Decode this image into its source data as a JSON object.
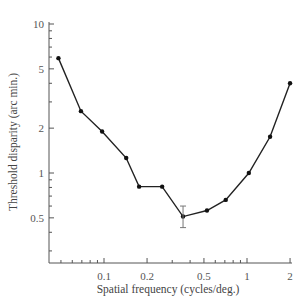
{
  "chart_data": {
    "type": "line",
    "title": "",
    "xlabel": "Spatial frequency (cycles/deg.)",
    "ylabel": "Threshold disparity (arc min.)",
    "xscale": "log",
    "yscale": "log",
    "xlim": [
      0.04,
      2.1
    ],
    "ylim": [
      0.3,
      10
    ],
    "x_ticks": [
      {
        "value": 0.1,
        "label": "0.1"
      },
      {
        "value": 0.2,
        "label": "0.2"
      },
      {
        "value": 0.5,
        "label": "0.5"
      },
      {
        "value": 1,
        "label": "1"
      },
      {
        "value": 2,
        "label": "2"
      }
    ],
    "y_ticks": [
      {
        "value": 0.5,
        "label": "0.5"
      },
      {
        "value": 1,
        "label": "1"
      },
      {
        "value": 2,
        "label": "2"
      },
      {
        "value": 5,
        "label": "5"
      },
      {
        "value": 10,
        "label": "10"
      }
    ],
    "grid": false,
    "legend": null,
    "series": [
      {
        "name": "Threshold disparity",
        "x": [
          0.048,
          0.069,
          0.097,
          0.143,
          0.176,
          0.255,
          0.357,
          0.525,
          0.71,
          1.03,
          1.45,
          2.0
        ],
        "y": [
          5.9,
          2.6,
          1.9,
          1.26,
          0.81,
          0.81,
          0.51,
          0.56,
          0.66,
          1.0,
          1.75,
          4.0
        ]
      }
    ],
    "error_bars": [
      {
        "x": 0.357,
        "y": 0.51,
        "low": 0.43,
        "high": 0.6
      }
    ]
  }
}
